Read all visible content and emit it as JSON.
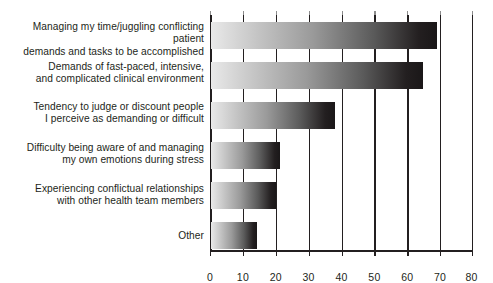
{
  "chart_data": {
    "type": "bar",
    "orientation": "horizontal",
    "title": "",
    "subtitle": "",
    "xlabel": "",
    "ylabel": "",
    "xlim": [
      0,
      80
    ],
    "xticks": [
      0,
      10,
      20,
      30,
      40,
      50,
      60,
      70,
      80
    ],
    "xtick_labels": [
      "0",
      "10",
      "20",
      "30",
      "40",
      "50",
      "60",
      "70",
      "80"
    ],
    "grid": true,
    "grid_axis": "x",
    "legend": false,
    "bar_fill": "horizontal gradient from light gray to black",
    "bar_color_light": "#e9e9e9",
    "bar_color_dark": "#231f20",
    "axis_color": "#231f20",
    "background": "#ffffff",
    "categories": [
      "Managing my time/juggling conflicting patient\ndemands and tasks to be accomplished",
      "Demands of fast-paced, intensive,\nand complicated clinical environment",
      "Tendency to judge or discount people\nI perceive as demanding or difficult",
      "Difficulty being aware of and managing\nmy own emotions during stress",
      "Experiencing conflictual relationships\nwith other health team members",
      "Other"
    ],
    "values": [
      69,
      65,
      38,
      21,
      20,
      14
    ]
  },
  "axis": {
    "ticks": [
      {
        "label": "0",
        "value": 0
      },
      {
        "label": "10",
        "value": 10
      },
      {
        "label": "20",
        "value": 20
      },
      {
        "label": "30",
        "value": 30
      },
      {
        "label": "40",
        "value": 40
      },
      {
        "label": "50",
        "value": 50
      },
      {
        "label": "60",
        "value": 60
      },
      {
        "label": "70",
        "value": 70
      },
      {
        "label": "80",
        "value": 80
      }
    ]
  }
}
